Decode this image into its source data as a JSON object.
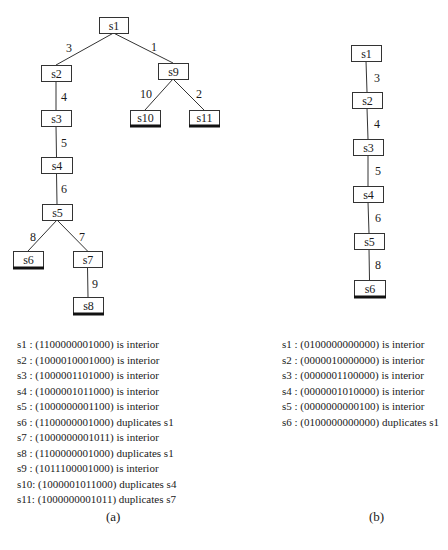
{
  "figure_a": {
    "caption": "(a)",
    "nodes": [
      {
        "id": "s1",
        "label": "s1",
        "x": 99,
        "y": 17,
        "w": 29,
        "h": 16,
        "leaf": false
      },
      {
        "id": "s2",
        "label": "s2",
        "x": 41,
        "y": 65,
        "w": 30,
        "h": 16,
        "leaf": false
      },
      {
        "id": "s9",
        "label": "s9",
        "x": 158,
        "y": 63,
        "w": 30,
        "h": 16,
        "leaf": false
      },
      {
        "id": "s10",
        "label": "s10",
        "x": 130,
        "y": 110,
        "w": 30,
        "h": 15,
        "leaf": true
      },
      {
        "id": "s11",
        "label": "s11",
        "x": 189,
        "y": 110,
        "w": 30,
        "h": 15,
        "leaf": true
      },
      {
        "id": "s3",
        "label": "s3",
        "x": 41,
        "y": 110,
        "w": 30,
        "h": 16,
        "leaf": false
      },
      {
        "id": "s4",
        "label": "s4",
        "x": 41,
        "y": 157,
        "w": 31,
        "h": 16,
        "leaf": false
      },
      {
        "id": "s5",
        "label": "s5",
        "x": 42,
        "y": 204,
        "w": 30,
        "h": 16,
        "leaf": false
      },
      {
        "id": "s6",
        "label": "s6",
        "x": 13,
        "y": 251,
        "w": 30,
        "h": 16,
        "leaf": true
      },
      {
        "id": "s7",
        "label": "s7",
        "x": 73,
        "y": 251,
        "w": 29,
        "h": 16,
        "leaf": false
      },
      {
        "id": "s8",
        "label": "s8",
        "x": 73,
        "y": 297,
        "w": 30,
        "h": 16,
        "leaf": true
      }
    ],
    "edges": [
      {
        "from": "s1",
        "to": "s2",
        "label": "3",
        "lx": 69,
        "ly": 48
      },
      {
        "from": "s1",
        "to": "s9",
        "label": "1",
        "lx": 154,
        "ly": 47
      },
      {
        "from": "s9",
        "to": "s10",
        "label": "10",
        "lx": 146,
        "ly": 94
      },
      {
        "from": "s9",
        "to": "s11",
        "label": "2",
        "lx": 199,
        "ly": 94
      },
      {
        "from": "s2",
        "to": "s3",
        "label": "4",
        "lx": 64,
        "ly": 97
      },
      {
        "from": "s3",
        "to": "s4",
        "label": "5",
        "lx": 64,
        "ly": 143
      },
      {
        "from": "s4",
        "to": "s5",
        "label": "6",
        "lx": 64,
        "ly": 189
      },
      {
        "from": "s5",
        "to": "s6",
        "label": "8",
        "lx": 33,
        "ly": 237
      },
      {
        "from": "s5",
        "to": "s7",
        "label": "7",
        "lx": 82,
        "ly": 237
      },
      {
        "from": "s7",
        "to": "s8",
        "label": "9",
        "lx": 95,
        "ly": 284
      }
    ],
    "states": [
      {
        "name": "s1 ",
        "vector": "1100000001000",
        "status": "is interior"
      },
      {
        "name": "s2 ",
        "vector": "1000010001000",
        "status": "is interior"
      },
      {
        "name": "s3 ",
        "vector": "1000001101000",
        "status": "is interior"
      },
      {
        "name": "s4 ",
        "vector": "1000001011000",
        "status": "is interior"
      },
      {
        "name": "s5 ",
        "vector": "1000000001100",
        "status": "is interior"
      },
      {
        "name": "s6 ",
        "vector": "1100000001000",
        "status": "duplicates s1"
      },
      {
        "name": "s7 ",
        "vector": "1000000001011",
        "status": "is interior"
      },
      {
        "name": "s8 ",
        "vector": "1100000001000",
        "status": "duplicates s1"
      },
      {
        "name": "s9 ",
        "vector": "1011100001000",
        "status": "is interior"
      },
      {
        "name": "s10",
        "vector": "1000001011000",
        "status": "duplicates s4"
      },
      {
        "name": "s11",
        "vector": "1000000001011",
        "status": "duplicates s7"
      }
    ]
  },
  "figure_b": {
    "caption": "(b)",
    "nodes": [
      {
        "id": "s1",
        "label": "s1",
        "x": 351,
        "y": 45,
        "w": 30,
        "h": 16,
        "leaf": false
      },
      {
        "id": "s2",
        "label": "s2",
        "x": 352,
        "y": 92,
        "w": 30,
        "h": 16,
        "leaf": false
      },
      {
        "id": "s3",
        "label": "s3",
        "x": 353,
        "y": 139,
        "w": 30,
        "h": 16,
        "leaf": false
      },
      {
        "id": "s4",
        "label": "s4",
        "x": 353,
        "y": 186,
        "w": 30,
        "h": 16,
        "leaf": false
      },
      {
        "id": "s5",
        "label": "s5",
        "x": 354,
        "y": 233,
        "w": 30,
        "h": 16,
        "leaf": false
      },
      {
        "id": "s6",
        "label": "s6",
        "x": 354,
        "y": 280,
        "w": 31,
        "h": 16,
        "leaf": true
      }
    ],
    "edges": [
      {
        "from": "s1",
        "to": "s2",
        "label": "3",
        "lx": 377,
        "ly": 78
      },
      {
        "from": "s2",
        "to": "s3",
        "label": "4",
        "lx": 377,
        "ly": 124
      },
      {
        "from": "s3",
        "to": "s4",
        "label": "5",
        "lx": 378,
        "ly": 171
      },
      {
        "from": "s4",
        "to": "s5",
        "label": "6",
        "lx": 378,
        "ly": 218
      },
      {
        "from": "s5",
        "to": "s6",
        "label": "8",
        "lx": 378,
        "ly": 265
      }
    ],
    "states": [
      {
        "name": "s1 ",
        "vector": "0100000000000",
        "status": "is interior"
      },
      {
        "name": "s2 ",
        "vector": "0000010000000",
        "status": "is interior"
      },
      {
        "name": "s3 ",
        "vector": "0000001100000",
        "status": "is interior"
      },
      {
        "name": "s4 ",
        "vector": "0000001010000",
        "status": "is interior"
      },
      {
        "name": "s5 ",
        "vector": "0000000000100",
        "status": "is interior"
      },
      {
        "name": "s6 ",
        "vector": "0100000000000",
        "status": "duplicates s1"
      }
    ]
  }
}
